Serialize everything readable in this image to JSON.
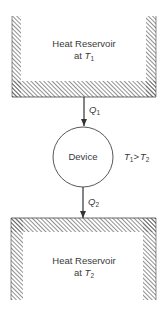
{
  "diagram": {
    "type": "heat-engine-schematic",
    "hot_reservoir": {
      "title": "Heat Reservoir",
      "temp_prefix": "at",
      "temp_symbol": "T",
      "temp_subscript": "1"
    },
    "device": {
      "label": "Device"
    },
    "cold_reservoir": {
      "title": "Heat Reservoir",
      "temp_prefix": "at",
      "temp_symbol": "T",
      "temp_subscript": "2"
    },
    "heat_in": {
      "symbol": "Q",
      "subscript": "1"
    },
    "heat_out": {
      "symbol": "Q",
      "subscript": "2"
    },
    "condition": {
      "left_symbol": "T",
      "left_subscript": "1",
      "operator": ">",
      "right_symbol": "T",
      "right_subscript": "2"
    },
    "colors": {
      "stroke": "#3a3a3a",
      "hatch": "#555555",
      "background": "#ffffff"
    }
  }
}
